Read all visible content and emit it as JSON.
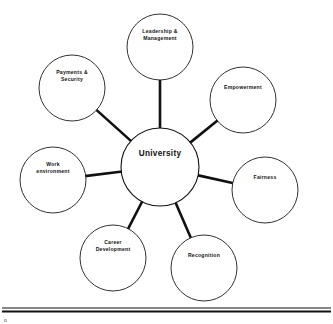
{
  "diagram": {
    "type": "hub-and-spoke-mind-map",
    "hub": {
      "label": "University",
      "cx": 160,
      "cy": 167,
      "r": 39
    },
    "nodes": [
      {
        "id": "leadership-management",
        "lines": [
          "Leadership &",
          "Management"
        ],
        "cx": 160,
        "cy": 47,
        "r": 33
      },
      {
        "id": "empowerment",
        "lines": [
          "Empowerment"
        ],
        "cx": 243,
        "cy": 100,
        "r": 33
      },
      {
        "id": "fairness",
        "lines": [
          "Fairness"
        ],
        "cx": 265,
        "cy": 190,
        "r": 33
      },
      {
        "id": "recognition",
        "lines": [
          "Recognition"
        ],
        "cx": 204,
        "cy": 268,
        "r": 33
      },
      {
        "id": "career-development",
        "lines": [
          "Career",
          "Development"
        ],
        "cx": 113,
        "cy": 258,
        "r": 33
      },
      {
        "id": "work-environment",
        "lines": [
          "Work",
          "environment"
        ],
        "cx": 53,
        "cy": 180,
        "r": 33
      },
      {
        "id": "payments-security",
        "lines": [
          "Payments &",
          "Security"
        ],
        "cx": 72,
        "cy": 88,
        "r": 33
      }
    ],
    "footer": {
      "mark": "o"
    },
    "colors": {
      "stroke": "#111111",
      "fill": "#ffffff",
      "text": "#111111"
    }
  }
}
